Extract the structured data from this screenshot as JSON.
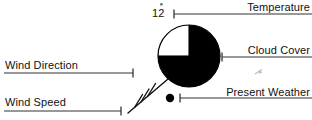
{
  "diagram": {
    "type": "station-model",
    "colors": {
      "ink": "#111111",
      "line": "#333333",
      "fill": "#000000",
      "background": "#ffffff"
    }
  },
  "callouts": {
    "temperature": {
      "label": "Temperature",
      "value": "12",
      "leader_side": "right"
    },
    "cloud_cover": {
      "label": "Cloud Cover",
      "leader_side": "right"
    },
    "present_weather": {
      "label": "Present Weather",
      "leader_side": "right"
    },
    "wind_direction": {
      "label": "Wind Direction",
      "leader_side": "left"
    },
    "wind_speed": {
      "label": "Wind Speed",
      "leader_side": "left"
    }
  },
  "symbols": {
    "cloud_cover_circle": {
      "name": "cloud-cover-circle",
      "center_x": 189,
      "center_y": 56,
      "radius": 31,
      "filled_fraction": "3/4",
      "clear_quadrant": "upper-left"
    },
    "present_weather_dot": {
      "name": "present-weather-dot",
      "center_x": 170,
      "center_y": 98,
      "radius": 4
    },
    "wind_barb": {
      "name": "wind-barb",
      "shaft_start_x": 168,
      "shaft_start_y": 79,
      "shaft_end_x": 128,
      "shaft_end_y": 113,
      "full_barbs": 3,
      "half_barbs": 0
    }
  }
}
